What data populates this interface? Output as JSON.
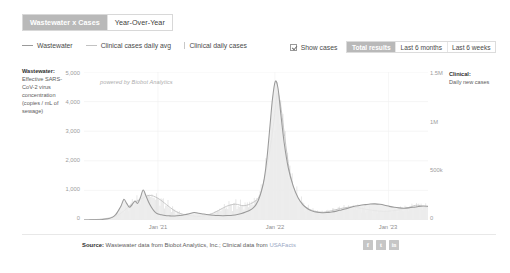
{
  "tabs": [
    {
      "label": "Wastewater x Cases",
      "active": true
    },
    {
      "label": "Year-Over-Year",
      "active": false
    }
  ],
  "legend": [
    {
      "label": "Wastewater",
      "marker": "line",
      "color": "#9a9a9a"
    },
    {
      "label": "Clinical cases daily avg",
      "marker": "line-alt",
      "color": "#c2c2c2"
    },
    {
      "label": "Clinical daily cases",
      "marker": "bar",
      "color": "#c8c8c8"
    }
  ],
  "controls": {
    "show_cases_label": "Show cases",
    "show_cases_checked": true,
    "ranges": [
      {
        "label": "Total results",
        "active": true
      },
      {
        "label": "Last 6 months",
        "active": false
      },
      {
        "label": "Last 6 weeks",
        "active": false
      }
    ]
  },
  "axis_left": {
    "title": "Wastewater:",
    "description": "Effective SARS-CoV-2 virus concentration (copies / mL of sewage)"
  },
  "axis_right": {
    "title": "Clinical:",
    "description": "Daily new cases"
  },
  "watermark": "powered by Biobot Analytics",
  "footer": {
    "source_label": "Source:",
    "source_text": " Wastewater data from Biobot Analytics, Inc.; Clinical data from ",
    "source_link": "USAFacts",
    "social": [
      {
        "name": "facebook",
        "glyph": "f"
      },
      {
        "name": "twitter",
        "glyph": "t"
      },
      {
        "name": "linkedin",
        "glyph": "in"
      }
    ]
  },
  "chart_data": {
    "type": "area",
    "title": "Wastewater x Cases",
    "xlabel": "",
    "ylabel": "Effective SARS-CoV-2 virus concentration (copies / mL of sewage)",
    "y2label": "Daily new cases",
    "grid": true,
    "legend_position": "top-left",
    "ylim": [
      0,
      5000
    ],
    "y2lim": [
      0,
      1500000
    ],
    "ytick_labels": [
      "5,000",
      "4,000",
      "3,000",
      "2,000",
      "1,000",
      "0"
    ],
    "ytick_values": [
      5000,
      4000,
      3000,
      2000,
      1000,
      0
    ],
    "y2tick_labels": [
      "1.5M",
      "1M",
      "500k",
      "0"
    ],
    "y2tick_values": [
      1500000,
      1000000,
      500000,
      0
    ],
    "xtick_labels": [
      "Jan '21",
      "Jan '22",
      "Jan '23"
    ],
    "xtick_positions": [
      0.215,
      0.555,
      0.885
    ],
    "series": [
      {
        "name": "Wastewater",
        "axis": "left",
        "unit": "copies / mL of sewage",
        "color": "#9a9a9a",
        "fill": "#ececec",
        "x": [
          0.0,
          0.02,
          0.038,
          0.055,
          0.07,
          0.082,
          0.092,
          0.1,
          0.108,
          0.116,
          0.124,
          0.132,
          0.14,
          0.148,
          0.156,
          0.164,
          0.172,
          0.18,
          0.188,
          0.196,
          0.204,
          0.212,
          0.224,
          0.236,
          0.25,
          0.264,
          0.278,
          0.292,
          0.306,
          0.32,
          0.334,
          0.348,
          0.362,
          0.376,
          0.39,
          0.404,
          0.418,
          0.432,
          0.446,
          0.458,
          0.47,
          0.482,
          0.492,
          0.5,
          0.508,
          0.516,
          0.524,
          0.532,
          0.54,
          0.548,
          0.556,
          0.564,
          0.572,
          0.582,
          0.594,
          0.608,
          0.622,
          0.636,
          0.65,
          0.664,
          0.678,
          0.692,
          0.706,
          0.72,
          0.734,
          0.748,
          0.762,
          0.776,
          0.79,
          0.804,
          0.818,
          0.832,
          0.846,
          0.86,
          0.874,
          0.888,
          0.902,
          0.916,
          0.93,
          0.944,
          0.958,
          0.972,
          0.986,
          1.0
        ],
        "y": [
          0,
          5,
          10,
          20,
          40,
          90,
          180,
          320,
          480,
          700,
          560,
          430,
          520,
          640,
          560,
          760,
          1010,
          820,
          600,
          430,
          300,
          220,
          180,
          150,
          140,
          135,
          150,
          175,
          210,
          250,
          230,
          200,
          175,
          160,
          150,
          145,
          150,
          160,
          185,
          220,
          270,
          330,
          410,
          520,
          700,
          980,
          1400,
          2100,
          3100,
          4100,
          4680,
          4450,
          3600,
          2600,
          1750,
          1150,
          760,
          520,
          380,
          300,
          260,
          245,
          250,
          270,
          300,
          340,
          380,
          430,
          470,
          500,
          520,
          540,
          545,
          530,
          500,
          460,
          430,
          410,
          400,
          410,
          430,
          455,
          470,
          460
        ]
      },
      {
        "name": "Clinical cases daily avg",
        "axis": "right",
        "unit": "daily new cases (7-day avg)",
        "color": "#c2c2c2",
        "x": [
          0.0,
          0.03,
          0.06,
          0.09,
          0.115,
          0.14,
          0.165,
          0.19,
          0.215,
          0.24,
          0.265,
          0.29,
          0.315,
          0.34,
          0.365,
          0.39,
          0.415,
          0.44,
          0.465,
          0.49,
          0.51,
          0.525,
          0.54,
          0.552,
          0.562,
          0.572,
          0.585,
          0.6,
          0.62,
          0.645,
          0.67,
          0.695,
          0.72,
          0.745,
          0.77,
          0.795,
          0.82,
          0.845,
          0.87,
          0.895,
          0.92,
          0.945,
          0.97,
          1.0
        ],
        "y": [
          0,
          4000,
          12000,
          35000,
          90000,
          165000,
          210000,
          250000,
          220000,
          155000,
          90000,
          55000,
          42000,
          38000,
          55000,
          95000,
          140000,
          160000,
          145000,
          175000,
          240000,
          420000,
          700000,
          1000000,
          1280000,
          1150000,
          800000,
          450000,
          230000,
          130000,
          90000,
          78000,
          95000,
          115000,
          130000,
          125000,
          108000,
          95000,
          88000,
          92000,
          105000,
          128000,
          150000,
          120000
        ]
      },
      {
        "name": "Clinical daily cases",
        "axis": "right",
        "unit": "daily new cases",
        "color": "#d2d2d2",
        "note": "thin vertical bars rendered beneath the daily-average line across the full date range"
      }
    ],
    "annotations": [
      {
        "text": "powered by Biobot Analytics",
        "type": "watermark"
      }
    ]
  }
}
